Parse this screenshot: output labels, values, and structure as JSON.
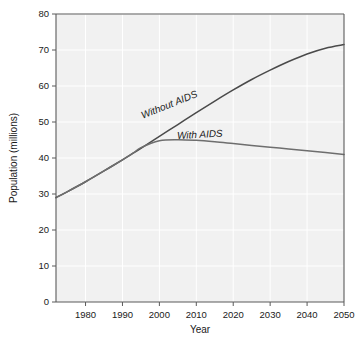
{
  "chart_data": {
    "type": "line",
    "title": "",
    "xlabel": "Year",
    "ylabel": "Population (millions)",
    "xlim": [
      1972,
      2050
    ],
    "ylim": [
      0,
      80
    ],
    "grid": true,
    "legend_position": "inline-curve-labels",
    "xticks": [
      "1980",
      "1990",
      "2000",
      "2010",
      "2020",
      "2030",
      "2040",
      "2050"
    ],
    "xtick_values": [
      1980,
      1990,
      2000,
      2010,
      2020,
      2030,
      2040,
      2050
    ],
    "yticks": [
      "0",
      "10",
      "20",
      "30",
      "40",
      "50",
      "60",
      "70",
      "80"
    ],
    "ytick_values": [
      0,
      10,
      20,
      30,
      40,
      50,
      60,
      70,
      80
    ],
    "x": [
      1972,
      1975,
      1980,
      1985,
      1990,
      1993,
      1995,
      2000,
      2005,
      2010,
      2015,
      2020,
      2025,
      2030,
      2035,
      2040,
      2045,
      2050
    ],
    "series": [
      {
        "name": "Without AIDS",
        "label": "Without AIDS",
        "color": "#4a4a4a",
        "values": [
          29.0,
          30.6,
          33.4,
          36.4,
          39.5,
          41.4,
          42.7,
          46.0,
          49.3,
          52.6,
          55.8,
          58.9,
          61.8,
          64.4,
          66.8,
          68.9,
          70.5,
          71.5
        ]
      },
      {
        "name": "With AIDS",
        "label": "With AIDS",
        "color": "#6e6e6e",
        "values": [
          29.0,
          30.6,
          33.4,
          36.4,
          39.5,
          41.4,
          42.9,
          44.8,
          45.1,
          44.9,
          44.5,
          44.0,
          43.5,
          43.0,
          42.5,
          42.0,
          41.5,
          41.0
        ]
      }
    ],
    "annotations": [
      {
        "text": "Without AIDS",
        "x": 2003,
        "y": 54.0,
        "rotation": -22
      },
      {
        "text": "With AIDS",
        "x": 2011,
        "y": 45.6,
        "rotation": -3
      }
    ],
    "colors": {
      "plot_background": "#f1f1f1",
      "page_background": "#ffffff",
      "gridline": "#ffffff",
      "axis": "#5a5a5a",
      "text": "#1a1a1a"
    }
  }
}
